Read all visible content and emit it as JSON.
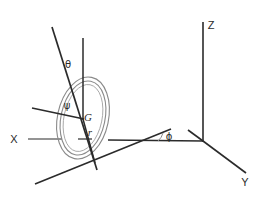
{
  "figure": {
    "background_color": "#ffffff",
    "line_color": "#2b2b2b",
    "ring_color": "#8a8a8a",
    "width": 269,
    "height": 197
  },
  "axes": {
    "z": {
      "label": "Z",
      "label_x": 211,
      "label_y": 29
    },
    "y": {
      "label": "Y",
      "label_x": 245,
      "label_y": 186
    },
    "x": {
      "label": "X",
      "label_x": 14,
      "label_y": 143
    }
  },
  "angles": {
    "theta": {
      "label": "θ",
      "label_x": 68,
      "label_y": 68
    },
    "psi": {
      "label": "ψ",
      "label_x": 67,
      "label_y": 109
    },
    "phi": {
      "label": "ϕ",
      "label_x": 169,
      "label_y": 140
    }
  },
  "points": {
    "center_of_mass": {
      "label": "G",
      "label_x": 88,
      "label_y": 121
    },
    "radius": {
      "label": "r",
      "label_x": 90,
      "label_y": 136
    }
  },
  "geometry": {
    "origin": {
      "x": 203,
      "y": 141
    },
    "gyro_center": {
      "x": 83,
      "y": 118
    },
    "ring_outer_rx": 26,
    "ring_outer_ry": 42,
    "ring_inner_rx": 22,
    "ring_inner_ry": 38,
    "ring_rotation_deg": 12
  }
}
